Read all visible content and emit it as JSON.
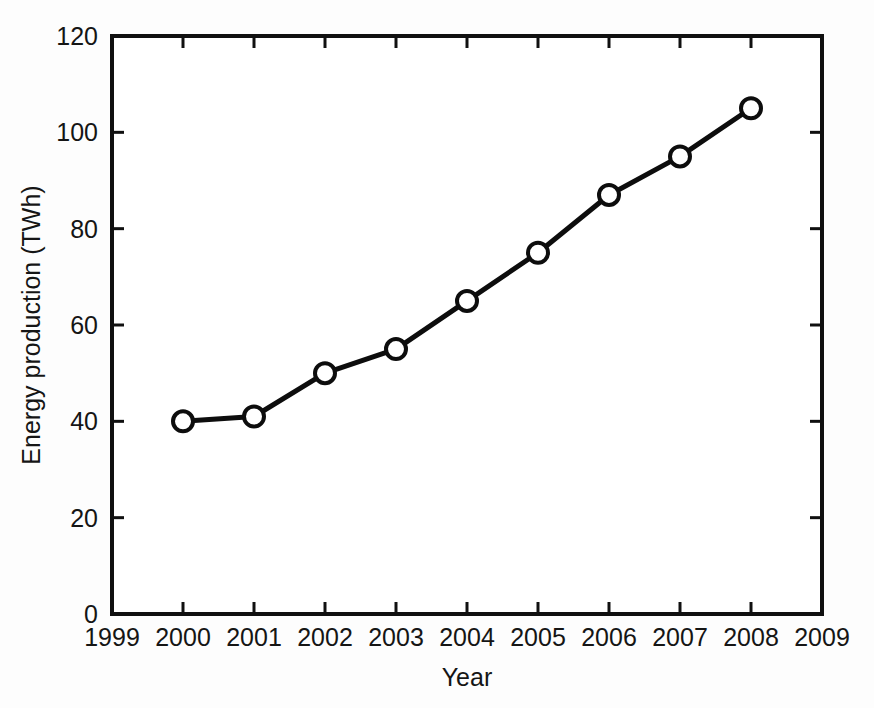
{
  "chart_data": {
    "type": "line",
    "title": "",
    "xlabel": "Year",
    "ylabel": "Energy production (TWh)",
    "x": [
      2000,
      2001,
      2002,
      2003,
      2004,
      2005,
      2006,
      2007,
      2008
    ],
    "values": [
      40,
      41,
      50,
      55,
      65,
      75,
      87,
      95,
      105
    ],
    "series": [
      {
        "name": "Energy production",
        "values": [
          40,
          41,
          50,
          55,
          65,
          75,
          87,
          95,
          105
        ],
        "marker": "open-circle",
        "color": "#0d0d0d"
      }
    ],
    "xlim": [
      1999,
      2009
    ],
    "ylim": [
      0,
      120
    ],
    "xticks": [
      1999,
      2000,
      2001,
      2002,
      2003,
      2004,
      2005,
      2006,
      2007,
      2008,
      2009
    ],
    "xtick_labels": [
      "1999",
      "2000",
      "2001",
      "2002",
      "2003",
      "2004",
      "2005",
      "2006",
      "2007",
      "2008",
      "2009"
    ],
    "yticks": [
      0,
      20,
      40,
      60,
      80,
      100,
      120
    ],
    "ytick_labels": [
      "0",
      "20",
      "40",
      "60",
      "80",
      "100",
      "120"
    ],
    "grid": false,
    "legend": "none",
    "tick_direction": "in",
    "frame": "box",
    "background": "#ffffff",
    "foreground": "#0d0d0d"
  },
  "axes": {
    "y_title": "Energy production (TWh)",
    "x_title": "Year"
  }
}
